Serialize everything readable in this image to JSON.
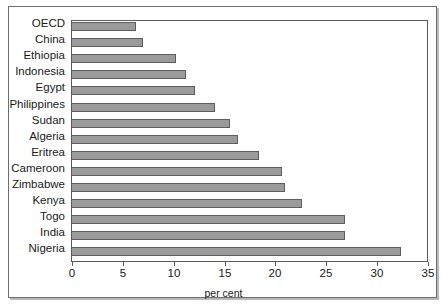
{
  "chart_data": {
    "type": "bar",
    "orientation": "horizontal",
    "title": "",
    "xlabel": "per cent",
    "ylabel": "",
    "xlim": [
      0,
      35
    ],
    "xticks": [
      0,
      5,
      10,
      15,
      20,
      25,
      30,
      35
    ],
    "xtick_labels": [
      "0",
      "5",
      "10",
      "15",
      "20",
      "25",
      "30",
      "35"
    ],
    "grid": false,
    "legend": null,
    "bar_color": "#9a9a9a",
    "bar_edge_color": "#5e5e5e",
    "categories": [
      "OECD",
      "China",
      "Ethiopia",
      "Indonesia",
      "Egypt",
      "Philippines",
      "Sudan",
      "Algeria",
      "Eritrea",
      "Cameroon",
      "Zimbabwe",
      "Kenya",
      "Togo",
      "India",
      "Nigeria"
    ],
    "values": [
      6.3,
      7.0,
      10.2,
      11.2,
      12.1,
      14.1,
      15.5,
      16.3,
      18.4,
      20.6,
      20.9,
      22.6,
      26.8,
      26.8,
      32.3
    ]
  }
}
